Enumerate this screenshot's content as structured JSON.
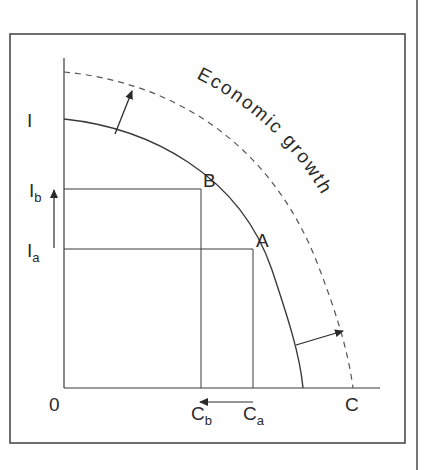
{
  "figure": {
    "title_clipped": "",
    "annotation": "Economic growth",
    "axis_labels": {
      "y_axis": "I",
      "x_axis": "C",
      "origin": "0"
    },
    "tick_labels": {
      "I_b": {
        "main": "I",
        "sub": "b"
      },
      "I_a": {
        "main": "I",
        "sub": "a"
      },
      "C_b": {
        "main": "C",
        "sub": "b"
      },
      "C_a": {
        "main": "C",
        "sub": "a"
      }
    },
    "points": {
      "A": "A",
      "B": "B"
    },
    "curves": [
      {
        "name": "original-ppf",
        "style": "solid"
      },
      {
        "name": "shifted-ppf",
        "style": "dashed"
      }
    ],
    "colors": {
      "line": "#3a3a3a",
      "frame": "#4a4a4a",
      "background": "#ffffff"
    }
  }
}
